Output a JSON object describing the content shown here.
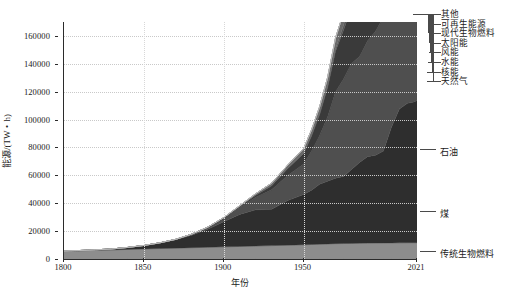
{
  "chart_data": {
    "type": "area",
    "title": "",
    "xlabel": "年份",
    "ylabel": "能源/(TW・h)",
    "xlim": [
      1800,
      2021
    ],
    "ylim": [
      0,
      170000
    ],
    "grid": true,
    "stacked": true,
    "legend_position": "right",
    "xticks": [
      {
        "value": 1800,
        "label": "1800"
      },
      {
        "value": 1850,
        "label": "1850"
      },
      {
        "value": 1900,
        "label": "1900"
      },
      {
        "value": 1950,
        "label": "1950"
      },
      {
        "value": 2021,
        "label": "2021"
      }
    ],
    "yticks": [
      {
        "value": 0,
        "label": "0"
      },
      {
        "value": 20000,
        "label": "20000"
      },
      {
        "value": 40000,
        "label": "40000"
      },
      {
        "value": 60000,
        "label": "60000"
      },
      {
        "value": 80000,
        "label": "80000"
      },
      {
        "value": 100000,
        "label": "100000"
      },
      {
        "value": 120000,
        "label": "120000"
      },
      {
        "value": 140000,
        "label": "140000"
      },
      {
        "value": 160000,
        "label": "160000"
      }
    ],
    "x": [
      1800,
      1810,
      1820,
      1830,
      1840,
      1850,
      1860,
      1870,
      1880,
      1890,
      1900,
      1910,
      1920,
      1930,
      1940,
      1950,
      1955,
      1960,
      1965,
      1970,
      1975,
      1980,
      1985,
      1990,
      1995,
      2000,
      2005,
      2010,
      2015,
      2019,
      2021
    ],
    "series": [
      {
        "name": "传统生物燃料",
        "color": "#8d8d8d",
        "values": [
          5600,
          5900,
          6200,
          6500,
          6900,
          7200,
          7500,
          7800,
          8100,
          8400,
          8700,
          9000,
          9300,
          9600,
          9900,
          10200,
          10400,
          10600,
          10800,
          11000,
          11100,
          11200,
          11300,
          11400,
          11450,
          11500,
          11550,
          11600,
          11650,
          11700,
          11700
        ]
      },
      {
        "name": "煤",
        "color": "#2e2e2e",
        "values": [
          100,
          200,
          400,
          700,
          1400,
          2500,
          4000,
          6000,
          9000,
          13000,
          18000,
          23000,
          26000,
          26000,
          32000,
          36000,
          39000,
          43000,
          45000,
          47000,
          48000,
          53000,
          58000,
          62000,
          63000,
          66000,
          83000,
          96000,
          100000,
          101000,
          102000
        ]
      },
      {
        "name": "石油",
        "color": "#4f4f4f",
        "values": [
          0,
          0,
          0,
          0,
          0,
          0,
          100,
          300,
          700,
          1300,
          2500,
          5000,
          9000,
          14000,
          18000,
          22000,
          28000,
          35000,
          46000,
          62000,
          70000,
          76000,
          76000,
          83000,
          89000,
          96000,
          105000,
          110000,
          117000,
          122000,
          118000
        ]
      },
      {
        "name": "天然气",
        "color": "#3a3a3a",
        "values": [
          0,
          0,
          0,
          0,
          0,
          0,
          0,
          0,
          50,
          120,
          300,
          700,
          1500,
          3000,
          5000,
          7500,
          11000,
          15000,
          21000,
          29000,
          35000,
          40000,
          45000,
          52000,
          57000,
          63000,
          72000,
          83000,
          92000,
          100000,
          103000
        ]
      },
      {
        "name": "核能",
        "color": "#565656",
        "values": [
          0,
          0,
          0,
          0,
          0,
          0,
          0,
          0,
          0,
          0,
          0,
          0,
          0,
          0,
          0,
          0,
          50,
          200,
          700,
          1600,
          3500,
          6500,
          12000,
          17000,
          19000,
          21000,
          22000,
          22000,
          22000,
          23000,
          23000
        ]
      },
      {
        "name": "水能",
        "color": "#6a6a6a",
        "values": [
          0,
          0,
          0,
          0,
          0,
          0,
          0,
          0,
          0,
          0,
          200,
          500,
          1000,
          1800,
          2400,
          3400,
          4200,
          5200,
          6400,
          7800,
          9000,
          10000,
          11500,
          13000,
          14500,
          16000,
          18000,
          21000,
          23500,
          25000,
          26000
        ]
      },
      {
        "name": "风能",
        "color": "#7a7a7a",
        "values": [
          0,
          0,
          0,
          0,
          0,
          0,
          0,
          0,
          0,
          0,
          0,
          0,
          0,
          0,
          0,
          0,
          0,
          0,
          0,
          0,
          0,
          0,
          0,
          100,
          200,
          500,
          1200,
          2600,
          5800,
          8200,
          9400
        ]
      },
      {
        "name": "太阳能",
        "color": "#8a8a8a",
        "values": [
          0,
          0,
          0,
          0,
          0,
          0,
          0,
          0,
          0,
          0,
          0,
          0,
          0,
          0,
          0,
          0,
          0,
          0,
          0,
          0,
          0,
          0,
          0,
          0,
          0,
          10,
          60,
          400,
          1800,
          4000,
          5400
        ]
      },
      {
        "name": "其他可再生能源",
        "color": "#9a9a9a",
        "values": [
          0,
          0,
          0,
          0,
          0,
          0,
          0,
          0,
          0,
          0,
          0,
          0,
          0,
          0,
          0,
          0,
          0,
          0,
          0,
          0,
          100,
          200,
          400,
          700,
          1100,
          1600,
          2200,
          3000,
          4000,
          4600,
          4900
        ]
      },
      {
        "name": "现代生物燃料",
        "color": "#b0b0b0",
        "values": [
          0,
          0,
          0,
          0,
          0,
          0,
          0,
          0,
          0,
          0,
          0,
          0,
          0,
          0,
          0,
          0,
          0,
          0,
          0,
          0,
          0,
          100,
          200,
          400,
          700,
          1100,
          2000,
          3000,
          3800,
          4300,
          4500
        ]
      },
      {
        "name": "其他",
        "color": "#c4c4c4",
        "values": [
          0,
          0,
          0,
          0,
          0,
          0,
          0,
          0,
          0,
          0,
          0,
          0,
          0,
          0,
          0,
          0,
          0,
          0,
          0,
          0,
          0,
          0,
          0,
          100,
          150,
          200,
          300,
          400,
          500,
          600,
          650
        ]
      }
    ],
    "legend_bracket": [
      {
        "label": "其他"
      },
      {
        "label": "可再生能源"
      },
      {
        "label": "现代生物燃料"
      },
      {
        "label": "太阳能"
      },
      {
        "label": "风能"
      },
      {
        "label": "水能"
      },
      {
        "label": "核能"
      },
      {
        "label": "天然气"
      }
    ],
    "direct_labels": [
      {
        "label": "石油"
      },
      {
        "label": "煤"
      },
      {
        "label": "传统生物燃料"
      }
    ]
  }
}
